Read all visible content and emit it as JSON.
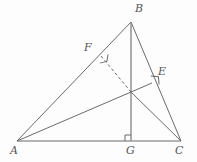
{
  "figure": {
    "type": "geometry-diagram",
    "width": 197,
    "height": 162,
    "background_color": "#fdfdfd",
    "line_color": "#6b6b6b",
    "label_color": "#555555",
    "points": {
      "A": {
        "label": "A",
        "x": 17,
        "y": 141,
        "label_x": 12,
        "label_y": 145
      },
      "B": {
        "label": "B",
        "x": 131,
        "y": 22,
        "label_x": 135,
        "label_y": 3
      },
      "C": {
        "label": "C",
        "x": 181,
        "y": 141,
        "label_x": 176,
        "label_y": 145
      },
      "G": {
        "label": "G",
        "x": 131,
        "y": 141,
        "label_x": 127,
        "label_y": 145
      },
      "E": {
        "label": "E",
        "x": 152,
        "y": 83,
        "label_x": 158,
        "label_y": 66
      },
      "F": {
        "label": "F",
        "x": 101,
        "y": 56,
        "label_x": 84,
        "label_y": 42
      },
      "H": {
        "label": "",
        "x": 131,
        "y": 92,
        "label_x": 131,
        "label_y": 92
      }
    },
    "segments": [
      {
        "name": "side-AB",
        "from": "A",
        "to": "B",
        "style": "solid"
      },
      {
        "name": "side-BC",
        "from": "B",
        "to": "C",
        "style": "solid"
      },
      {
        "name": "side-AC",
        "from": "A",
        "to": "C",
        "style": "solid"
      },
      {
        "name": "altitude-BG",
        "from": "B",
        "to": "G",
        "style": "solid"
      },
      {
        "name": "altitude-AE",
        "from": "A",
        "to": "E",
        "style": "solid"
      },
      {
        "name": "altitude-CF-dashed",
        "from": "F",
        "to": "H",
        "style": "dashed"
      },
      {
        "name": "altitude-CF-solid",
        "from": "H",
        "to": "C",
        "style": "solid"
      }
    ],
    "right_angle_marks": [
      {
        "name": "right-angle-at-G",
        "at": "G",
        "size": 6
      },
      {
        "name": "right-angle-at-E",
        "at": "E",
        "size": 7
      },
      {
        "name": "right-angle-at-F",
        "at": "F",
        "size": 7
      }
    ]
  }
}
